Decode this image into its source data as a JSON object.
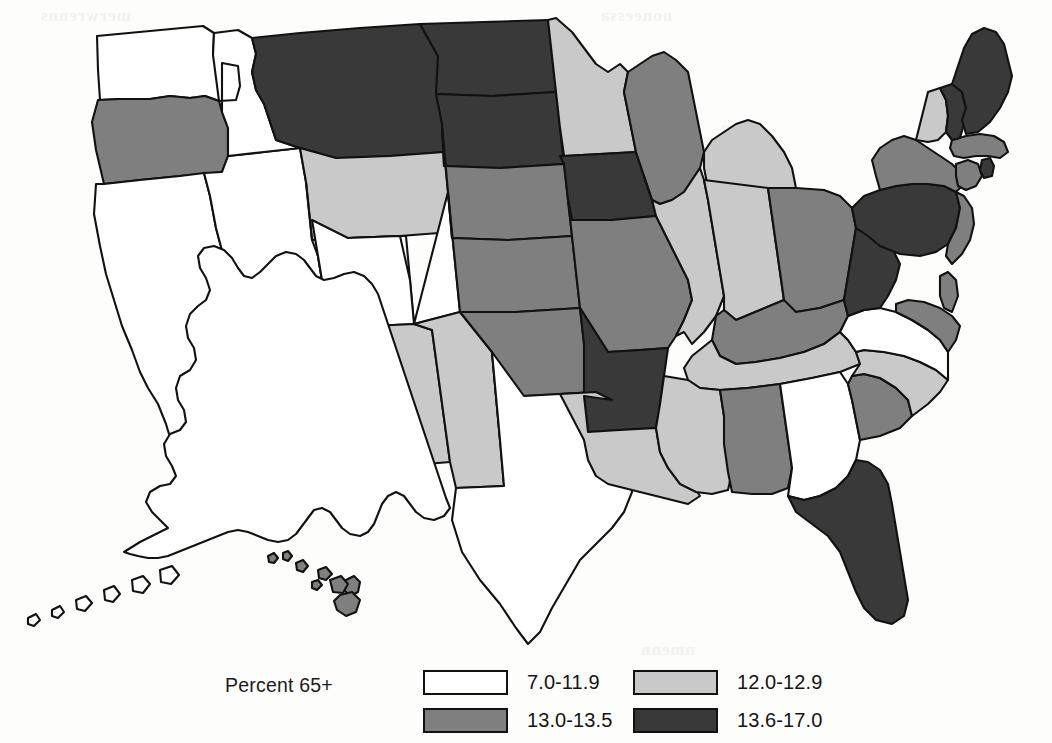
{
  "figure": {
    "kind": "choropleth-map",
    "region": "United States",
    "legend_title": "Percent 65+"
  },
  "legend": {
    "title": "Percent 65+",
    "classes": [
      {
        "label": "7.0-11.9",
        "color": "#ffffff",
        "name": "class-lowest"
      },
      {
        "label": "12.0-12.9",
        "color": "#c9c9c9",
        "name": "class-low"
      },
      {
        "label": "13.0-13.5",
        "color": "#7f7f7f",
        "name": "class-high"
      },
      {
        "label": "13.6-17.0",
        "color": "#393939",
        "name": "class-highest"
      }
    ]
  },
  "palette": {
    "lowest": "#ffffff",
    "low": "#c9c9c9",
    "high": "#7f7f7f",
    "highest": "#393939",
    "outline": "#111111",
    "background": "#fdfdfc"
  },
  "ghost_text": {
    "g1": "merwrenns",
    "g2": "noneessa",
    "g3": "omen",
    "g4": "anoun",
    "g5": "eleron",
    "g6": "nmenn",
    "g7": "ansm"
  },
  "chart_data": {
    "type": "heatmap",
    "title": "Percent 65+",
    "subtitle": "",
    "xlabel": "",
    "ylabel": "",
    "legend_position": "bottom",
    "grid": false,
    "value_unit": "percent",
    "class_breaks": [
      "7.0-11.9",
      "12.0-12.9",
      "13.0-13.5",
      "13.6-17.0"
    ],
    "class_colors": [
      "#ffffff",
      "#c9c9c9",
      "#7f7f7f",
      "#393939"
    ],
    "categories": [
      "Alabama",
      "Alaska",
      "Arizona",
      "Arkansas",
      "California",
      "Colorado",
      "Connecticut",
      "Delaware",
      "Florida",
      "Georgia",
      "Hawaii",
      "Idaho",
      "Illinois",
      "Indiana",
      "Iowa",
      "Kansas",
      "Kentucky",
      "Louisiana",
      "Maine",
      "Maryland",
      "Massachusetts",
      "Michigan",
      "Minnesota",
      "Mississippi",
      "Missouri",
      "Montana",
      "Nebraska",
      "Nevada",
      "New Hampshire",
      "New Jersey",
      "New Mexico",
      "New York",
      "North Carolina",
      "North Dakota",
      "Ohio",
      "Oklahoma",
      "Oregon",
      "Pennsylvania",
      "Rhode Island",
      "South Carolina",
      "South Dakota",
      "Tennessee",
      "Texas",
      "Utah",
      "Vermont",
      "Virginia",
      "Washington",
      "West Virginia",
      "Wisconsin",
      "Wyoming"
    ],
    "values": [
      "13.0-13.5",
      "7.0-11.9",
      "12.0-12.9",
      "13.6-17.0",
      "7.0-11.9",
      "7.0-11.9",
      "13.0-13.5",
      "13.0-13.5",
      "13.6-17.0",
      "7.0-11.9",
      "13.0-13.5",
      "7.0-11.9",
      "12.0-12.9",
      "12.0-12.9",
      "13.6-17.0",
      "13.0-13.5",
      "13.0-13.5",
      "12.0-12.9",
      "13.6-17.0",
      "13.0-13.5",
      "13.0-13.5",
      "12.0-12.9",
      "12.0-12.9",
      "12.0-12.9",
      "13.0-13.5",
      "13.6-17.0",
      "13.0-13.5",
      "7.0-11.9",
      "13.6-17.0",
      "13.0-13.5",
      "12.0-12.9",
      "13.0-13.5",
      "12.0-12.9",
      "13.6-17.0",
      "13.0-13.5",
      "13.0-13.5",
      "13.0-13.5",
      "13.6-17.0",
      "13.6-17.0",
      "13.0-13.5",
      "13.6-17.0",
      "12.0-12.9",
      "7.0-11.9",
      "7.0-11.9",
      "12.0-12.9",
      "7.0-11.9",
      "7.0-11.9",
      "13.6-17.0",
      "13.0-13.5",
      "12.0-12.9"
    ]
  }
}
